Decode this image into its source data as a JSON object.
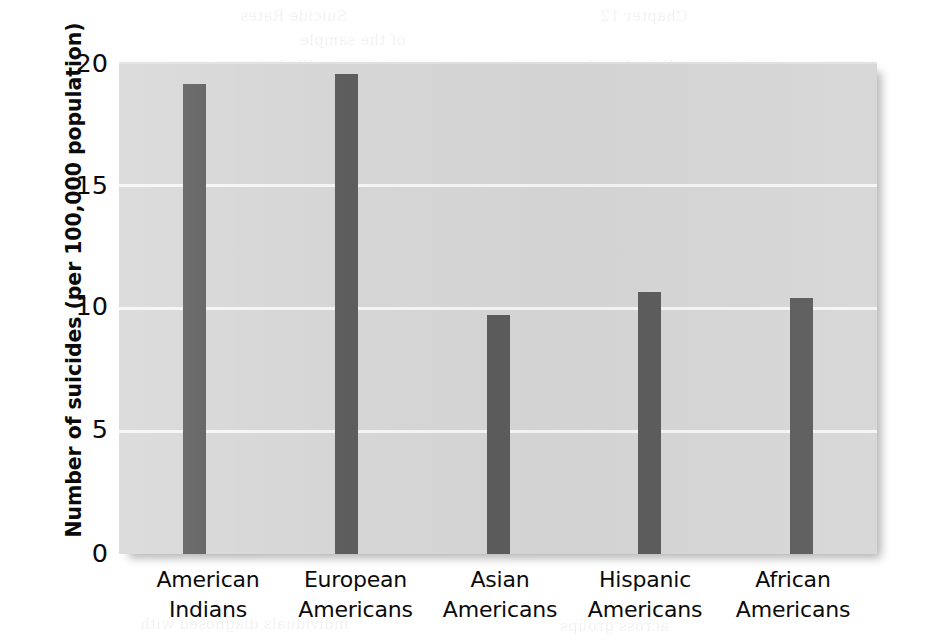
{
  "chart_data": {
    "type": "bar",
    "title": "",
    "subtitle": "",
    "xlabel": "",
    "ylabel": "Number of suicides (per 100,000 population)",
    "categories": [
      "American\nIndians",
      "European\nAmericans",
      "Asian\nAmericans",
      "Hispanic\nAmericans",
      "African\nAmericans"
    ],
    "values": [
      19.1,
      19.5,
      9.7,
      10.65,
      10.4
    ],
    "ylim": [
      0,
      20
    ],
    "yticks": [
      "0",
      "5",
      "10",
      "15",
      "20"
    ],
    "ytick_values": [
      0,
      5,
      10,
      15,
      20
    ],
    "grid": true,
    "legend": "none",
    "colors": {
      "bar": "#5b5b5b",
      "panel_background": "#d6d6d6",
      "gridline": "#f7f7f7",
      "page_background": "#ffffff",
      "text": "#0b0b0b"
    }
  },
  "axis": {
    "y_title": "Number of suicides (per 100,000 population)",
    "ticks": [
      "20",
      "15",
      "10",
      "5",
      "0"
    ]
  },
  "bleed_text": [
    "of the sample",
    "were more likely to",
    "reported feeling",
    "the relationship",
    "these findings in",
    "and the likelihood of",
    "in the general population",
    "of depression among",
    "factors in assessing risk",
    "are particularly important",
    "with a history of prior",
    "Suicide and Depression",
    "a strong link between the",
    "of completed suicides",
    "individuals diagnosed with"
  ]
}
